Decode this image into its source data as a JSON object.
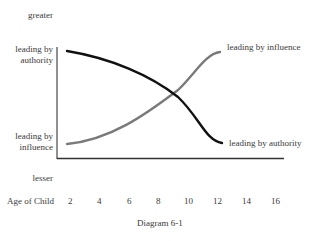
{
  "diagram": {
    "caption": "Diagram 6-1",
    "y_axis": {
      "top_label": "greater",
      "bottom_label": "lesser",
      "upper_left_label_line1": "leading by",
      "upper_left_label_line2": "authority",
      "lower_left_label_line1": "leading by",
      "lower_left_label_line2": "influence"
    },
    "x_axis": {
      "label": "Age of Child",
      "ticks": [
        "2",
        "4",
        "6",
        "8",
        "10",
        "12",
        "14",
        "16"
      ]
    },
    "curves": [
      {
        "name": "leading by authority",
        "end_label": "leading by authority",
        "color": "#111111",
        "trend": "decreasing"
      },
      {
        "name": "leading by influence",
        "end_label": "leading by influence",
        "color": "#7a7a7a",
        "trend": "increasing"
      }
    ]
  }
}
